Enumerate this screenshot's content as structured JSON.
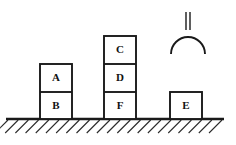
{
  "diagram": {
    "canvas": {
      "width": 236,
      "height": 145
    },
    "colors": {
      "outline": "#1a1a1a",
      "ground": "#1a1a1a",
      "hatch": "#2b2b2b",
      "block_fill": "#ffffff",
      "background": "#ffffff",
      "label": "#111111"
    },
    "ground": {
      "name": "table-surface",
      "y": 119,
      "x_start": 8,
      "x_end": 222,
      "hatch_count": 22,
      "hatch_direction": "forward-slash",
      "hatch_length": 13
    },
    "gripper": {
      "name": "robot-gripper",
      "arc_center_x": 188,
      "arc_center_y": 46,
      "arc_radius": 17,
      "stem_x_left": 186,
      "stem_x_right": 190,
      "stem_top_y": 12,
      "stem_bottom_y": 46
    },
    "stacks": [
      {
        "name": "stack-left",
        "x": 40,
        "width": 32,
        "blocks": [
          {
            "label": "A",
            "top": 64,
            "bottom": 92
          },
          {
            "label": "B",
            "top": 92,
            "bottom": 119
          }
        ]
      },
      {
        "name": "stack-middle",
        "x": 104,
        "width": 32,
        "blocks": [
          {
            "label": "C",
            "top": 36,
            "bottom": 64
          },
          {
            "label": "D",
            "top": 64,
            "bottom": 92
          },
          {
            "label": "F",
            "top": 92,
            "bottom": 119
          }
        ]
      },
      {
        "name": "stack-right",
        "x": 170,
        "width": 32,
        "blocks": [
          {
            "label": "E",
            "top": 92,
            "bottom": 119
          }
        ]
      }
    ],
    "block_labels": [
      "A",
      "B",
      "C",
      "D",
      "F",
      "E"
    ]
  }
}
